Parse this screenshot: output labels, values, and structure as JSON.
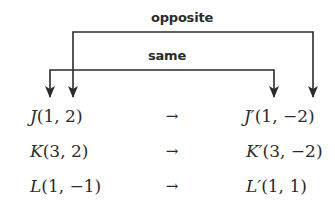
{
  "diagram": {
    "labels": {
      "outer": "opposite",
      "inner": "same"
    },
    "mapping_symbol": "→",
    "rows": [
      {
        "orig_name": "J",
        "orig_coords": "(1, 2)",
        "img_name": "J′",
        "img_coords": "(1, −2)"
      },
      {
        "orig_name": "K",
        "orig_coords": "(3, 2)",
        "img_name": "K′",
        "img_coords": "(3, −2)"
      },
      {
        "orig_name": "L",
        "orig_coords": "(1, −1)",
        "img_name": "L′",
        "img_coords": "(1, 1)"
      }
    ],
    "colors": {
      "ink": "#2b2b2b",
      "background": "#ffffff"
    }
  }
}
